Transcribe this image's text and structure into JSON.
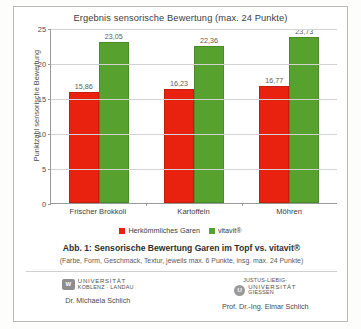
{
  "chart_data": {
    "type": "bar",
    "title": "Ergebnis sensorische Bewertung (max. 24 Punkte)",
    "xlabel": "",
    "ylabel": "Punktzahl sensorische Bewertung",
    "categories": [
      "Frischer Brokkoli",
      "Kartoffeln",
      "Möhren"
    ],
    "series": [
      {
        "name": "Herkömmliches Garen",
        "color": "#e8220e",
        "values": [
          15.86,
          16.23,
          16.77
        ],
        "labels": [
          "15,86",
          "16,23",
          "16,77"
        ]
      },
      {
        "name": "vitavit®",
        "color": "#57a12f",
        "values": [
          23.05,
          22.36,
          23.73
        ],
        "labels": [
          "23,05",
          "22,36",
          "23,73"
        ]
      }
    ],
    "ylim": [
      0,
      25
    ],
    "yticks": [
      0,
      5,
      10,
      15,
      20,
      25
    ],
    "ytick_labels": [
      "0",
      "5",
      "10",
      "15",
      "20",
      "25"
    ],
    "grid": true,
    "legend_position": "bottom"
  },
  "caption": {
    "main": "Abb. 1: Sensorische Bewertung Garen im Topf vs. vitavit®",
    "sub": "(Farbe, Form, Geschmack, Textur, jeweils max. 6 Punkte, insg. max. 24 Punkte)"
  },
  "footer": {
    "left": {
      "logo_line1": "UNIVERSITÄT",
      "logo_line2": "KOBLENZ · LANDAU",
      "logo_glyph": "W",
      "person": "Dr. Michaela Schlich"
    },
    "right": {
      "logo_line0": "JUSTUS-LIEBIG-",
      "logo_line1": "UNIVERSITÄT",
      "logo_line2": "GIESSEN",
      "logo_glyph": "U",
      "person": "Prof. Dr.-Ing. Elmar Schlich"
    }
  }
}
